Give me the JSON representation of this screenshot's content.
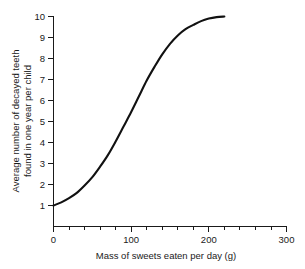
{
  "chart_data": {
    "type": "line",
    "title": "",
    "xlabel": "Mass of sweets eaten per day (g)",
    "ylabel": "Average number of decayed teeth found in one year per child",
    "ylabel_line1": "Average number of decayed teeth",
    "ylabel_line2": "found in one year per child",
    "xlim": [
      0,
      300
    ],
    "ylim": [
      0,
      10
    ],
    "grid": false,
    "legend": "none",
    "x_ticks_major": [
      0,
      100,
      200,
      300
    ],
    "x_tick_labels": [
      "0",
      "100",
      "200",
      "300"
    ],
    "x_ticks_minor": [
      20,
      40,
      60,
      80,
      120,
      140,
      160,
      180,
      220,
      240,
      260,
      280
    ],
    "y_ticks_major": [
      1,
      2,
      3,
      4,
      5,
      6,
      7,
      8,
      9,
      10
    ],
    "y_tick_labels": [
      "1",
      "2",
      "3",
      "4",
      "5",
      "6",
      "7",
      "8",
      "9",
      "10"
    ],
    "series": [
      {
        "name": "decayed teeth vs sweets",
        "color": "#111111",
        "x": [
          0,
          10,
          20,
          30,
          40,
          50,
          60,
          70,
          80,
          90,
          100,
          110,
          120,
          130,
          140,
          150,
          160,
          170,
          180,
          190,
          200,
          210,
          220
        ],
        "y": [
          1.0,
          1.15,
          1.35,
          1.6,
          1.95,
          2.35,
          2.85,
          3.4,
          4.05,
          4.75,
          5.45,
          6.2,
          6.95,
          7.6,
          8.2,
          8.7,
          9.1,
          9.4,
          9.6,
          9.78,
          9.9,
          9.97,
          10.0
        ]
      }
    ],
    "colors": {
      "background": "#ffffff",
      "axis": "#1a1a1a",
      "curve": "#111111"
    }
  }
}
